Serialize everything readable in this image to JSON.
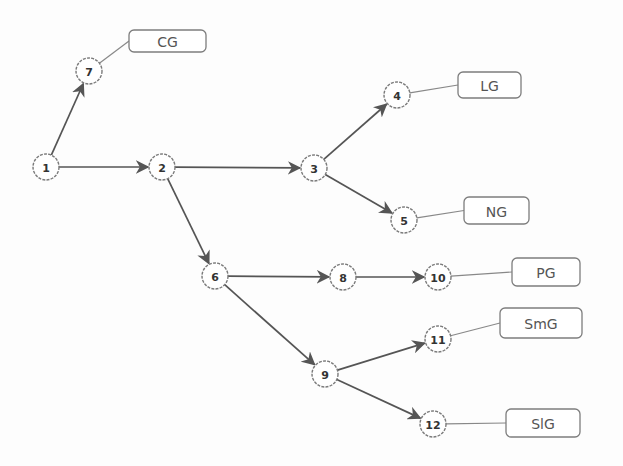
{
  "diagram": {
    "type": "tree",
    "nodes": [
      {
        "id": "1",
        "label": "1",
        "x": 46,
        "y": 167
      },
      {
        "id": "2",
        "label": "2",
        "x": 162,
        "y": 167
      },
      {
        "id": "3",
        "label": "3",
        "x": 314,
        "y": 168
      },
      {
        "id": "4",
        "label": "4",
        "x": 397,
        "y": 95
      },
      {
        "id": "5",
        "label": "5",
        "x": 404,
        "y": 220
      },
      {
        "id": "6",
        "label": "6",
        "x": 215,
        "y": 276
      },
      {
        "id": "7",
        "label": "7",
        "x": 89,
        "y": 71
      },
      {
        "id": "8",
        "label": "8",
        "x": 343,
        "y": 277
      },
      {
        "id": "9",
        "label": "9",
        "x": 325,
        "y": 374
      },
      {
        "id": "10",
        "label": "10",
        "x": 438,
        "y": 277
      },
      {
        "id": "11",
        "label": "11",
        "x": 438,
        "y": 339
      },
      {
        "id": "12",
        "label": "12",
        "x": 433,
        "y": 424
      }
    ],
    "edges": [
      {
        "from": "1",
        "to": "7"
      },
      {
        "from": "1",
        "to": "2"
      },
      {
        "from": "2",
        "to": "3"
      },
      {
        "from": "2",
        "to": "6"
      },
      {
        "from": "3",
        "to": "4"
      },
      {
        "from": "3",
        "to": "5"
      },
      {
        "from": "6",
        "to": "8"
      },
      {
        "from": "6",
        "to": "9"
      },
      {
        "from": "8",
        "to": "10"
      },
      {
        "from": "9",
        "to": "11"
      },
      {
        "from": "9",
        "to": "12"
      }
    ],
    "labels": [
      {
        "node": "7",
        "text": "CG",
        "x": 129,
        "y": 30,
        "w": 77,
        "h": 22
      },
      {
        "node": "4",
        "text": "LG",
        "x": 458,
        "y": 72,
        "w": 63,
        "h": 26
      },
      {
        "node": "5",
        "text": "NG",
        "x": 464,
        "y": 197,
        "w": 65,
        "h": 27
      },
      {
        "node": "10",
        "text": "PG",
        "x": 512,
        "y": 258,
        "w": 68,
        "h": 28
      },
      {
        "node": "11",
        "text": "SmG",
        "x": 500,
        "y": 308,
        "w": 82,
        "h": 30
      },
      {
        "node": "12",
        "text": "SlG",
        "x": 506,
        "y": 409,
        "w": 74,
        "h": 28
      }
    ],
    "colors": {
      "edge": "#555555",
      "node_stroke": "#7a7a7a",
      "text": "#333333",
      "background": "#fdfdfd"
    }
  }
}
